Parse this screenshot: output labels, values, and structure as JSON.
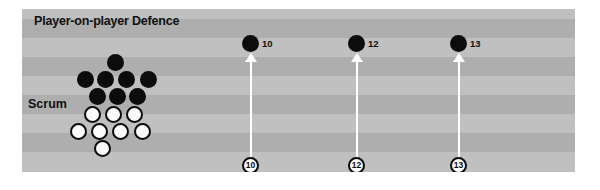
{
  "diagram": {
    "title": "Player-on-player Defence",
    "scrum_label": "Scrum",
    "colors": {
      "pitch_light": "#c0c0c0",
      "pitch_dark": "#aeaeae",
      "attacker": "#0c0c0c",
      "defender": "#fbfbfb",
      "arrow": "#ffffff",
      "text": "#111111"
    }
  },
  "pitch": {
    "stripes": [
      {
        "top": 0,
        "height": 10,
        "tone": "light"
      },
      {
        "top": 10,
        "height": 19,
        "tone": "dark"
      },
      {
        "top": 29,
        "height": 19,
        "tone": "light"
      },
      {
        "top": 48,
        "height": 19,
        "tone": "dark"
      },
      {
        "top": 67,
        "height": 19,
        "tone": "light"
      },
      {
        "top": 86,
        "height": 19,
        "tone": "dark"
      },
      {
        "top": 105,
        "height": 19,
        "tone": "light"
      },
      {
        "top": 124,
        "height": 19,
        "tone": "dark"
      },
      {
        "top": 143,
        "height": 20,
        "tone": "light"
      }
    ]
  },
  "scrum": {
    "attackers": [
      {
        "x": 85,
        "y": 45
      },
      {
        "x": 55,
        "y": 62
      },
      {
        "x": 75,
        "y": 62
      },
      {
        "x": 96,
        "y": 62
      },
      {
        "x": 118,
        "y": 62
      },
      {
        "x": 67,
        "y": 79
      },
      {
        "x": 87,
        "y": 79
      },
      {
        "x": 107,
        "y": 79
      }
    ],
    "defenders": [
      {
        "x": 62,
        "y": 97
      },
      {
        "x": 83,
        "y": 97
      },
      {
        "x": 104,
        "y": 97
      },
      {
        "x": 48,
        "y": 114
      },
      {
        "x": 69,
        "y": 114
      },
      {
        "x": 90,
        "y": 114
      },
      {
        "x": 112,
        "y": 114
      },
      {
        "x": 72,
        "y": 131
      }
    ]
  },
  "backs": [
    {
      "number": "10",
      "dot_x": 220,
      "dot_y": 26,
      "arrow_x": 222,
      "arrow_top": 44,
      "arrow_bottom": 148,
      "marker_x": 220,
      "marker_y": 148
    },
    {
      "number": "12",
      "dot_x": 326,
      "dot_y": 26,
      "arrow_x": 328,
      "arrow_top": 44,
      "arrow_bottom": 148,
      "marker_x": 326,
      "marker_y": 148
    },
    {
      "number": "13",
      "dot_x": 428,
      "dot_y": 26,
      "arrow_x": 430,
      "arrow_top": 44,
      "arrow_bottom": 148,
      "marker_x": 428,
      "marker_y": 148
    }
  ]
}
